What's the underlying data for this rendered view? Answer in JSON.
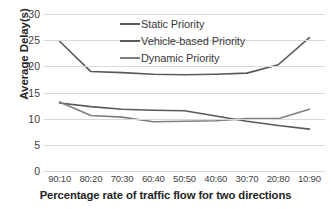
{
  "chart_data": {
    "type": "line",
    "title": "",
    "subtitle": "",
    "xlabel": "Percentage rate of traffic flow for two directions",
    "ylabel": "Average Delay(s)",
    "categories": [
      "90:10",
      "80:20",
      "70:30",
      "60:40",
      "50:50",
      "40:60",
      "30:70",
      "20:80",
      "10:90"
    ],
    "ylim": [
      0,
      30
    ],
    "yticks": [
      0,
      5,
      10,
      15,
      20,
      25,
      30
    ],
    "ytick_labels": [
      "0",
      "5",
      "10",
      "15",
      "20",
      "25",
      "30"
    ],
    "grid": "horizontal",
    "legend_position": "top-center",
    "series": [
      {
        "name": "Static Priority",
        "color": "#595959",
        "values": [
          24.8,
          19.0,
          18.8,
          18.5,
          18.4,
          18.5,
          18.7,
          20.3,
          25.5
        ]
      },
      {
        "name": "Vehicle-based Priority",
        "color": "#595959",
        "values": [
          13.0,
          12.3,
          11.8,
          11.6,
          11.5,
          10.5,
          9.5,
          8.7,
          8.0
        ]
      },
      {
        "name": "Dynamic Priority",
        "color": "#7f7f7f",
        "values": [
          13.2,
          10.6,
          10.3,
          9.4,
          9.5,
          9.6,
          10.0,
          10.0,
          11.8
        ]
      }
    ]
  },
  "colors": {
    "gridline": "#d9d9d9",
    "axis_text": "#404040",
    "label_text": "#242424",
    "background": "#ffffff"
  }
}
